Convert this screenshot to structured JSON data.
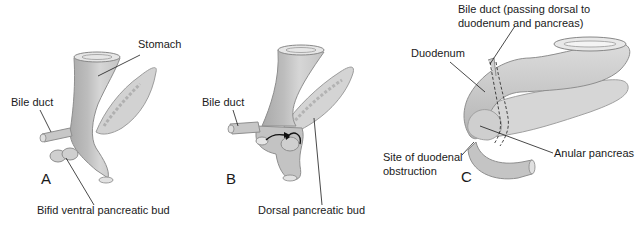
{
  "figure": {
    "panels": [
      {
        "id": "A",
        "letter": "A",
        "labels": {
          "stomach": "Stomach",
          "bile_duct": "Bile duct",
          "ventral_bud": "Bifid ventral pancreatic bud"
        }
      },
      {
        "id": "B",
        "letter": "B",
        "labels": {
          "bile_duct": "Bile duct",
          "dorsal_bud": "Dorsal pancreatic bud"
        }
      },
      {
        "id": "C",
        "letter": "C",
        "labels": {
          "bile_duct_line1": "Bile duct (passing dorsal to",
          "bile_duct_line2": "duodenum and pancreas)",
          "duodenum": "Duodenum",
          "site_line1": "Site of duodenal",
          "site_line2": "obstruction",
          "anular": "Anular pancreas"
        }
      }
    ],
    "colors": {
      "organ_fill": "#c9c9c9",
      "organ_light": "#dedede",
      "organ_dark": "#a8a8a8",
      "pancreas_fill": "#d4d4d4",
      "line": "#1a1a1a",
      "background": "#ffffff"
    }
  }
}
